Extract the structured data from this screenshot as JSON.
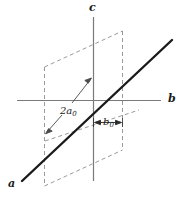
{
  "figure": {
    "colors": {
      "axis": "#7a7a7a",
      "solid_line": "#1a1a1a",
      "dashed_plane": "#9a9a9a",
      "text": "#1a1a1a",
      "background": "#ffffff"
    },
    "axes": [
      {
        "id": "c",
        "label": "c",
        "orientation": "vertical",
        "label_position": "top"
      },
      {
        "id": "b",
        "label": "b",
        "orientation": "horizontal",
        "label_position": "right"
      },
      {
        "id": "a",
        "label": "a",
        "orientation": "diagonal",
        "label_position": "bottom-left"
      }
    ],
    "annotations": [
      {
        "id": "spacing-2a0",
        "label_text": "2a",
        "label_sub": "0",
        "label_full": "2a₀",
        "arrow_style": "two-leader-arrows",
        "description": "leader arrows from label to the a-axis line and to the dashed plane edge"
      },
      {
        "id": "spacing-b0",
        "label_text": "b",
        "label_sub": "0",
        "label_full": "b₀",
        "arrow_style": "double-headed-dimension",
        "description": "double-headed dimension arrow between the c axis and the right dashed plane edge"
      }
    ],
    "shapes": [
      {
        "id": "dashed-plane",
        "type": "parallelogram",
        "style": "dashed"
      },
      {
        "id": "a-axis-line",
        "type": "line",
        "style": "solid-thick"
      }
    ]
  }
}
